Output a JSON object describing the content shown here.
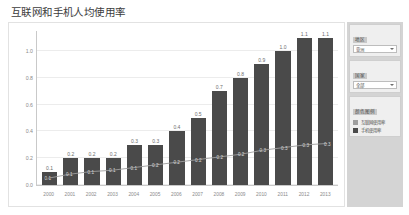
{
  "header": {
    "title": "互联网和手机人均使用率"
  },
  "chart_data": {
    "type": "bar",
    "title": "互联网和手机人均使用率",
    "xlabel": "",
    "ylabel": "",
    "ylim": [
      0.0,
      1.15
    ],
    "grid": true,
    "legend_position": "right-panel",
    "categories": [
      "2000",
      "2001",
      "2002",
      "2003",
      "2004",
      "2005",
      "2006",
      "2007",
      "2008",
      "2009",
      "2010",
      "2011",
      "2012",
      "2013"
    ],
    "ytick_labels": [
      "0.0",
      "0.2",
      "0.4",
      "0.6",
      "0.8",
      "1.0"
    ],
    "ytick_values": [
      0.0,
      0.2,
      0.4,
      0.6,
      0.8,
      1.0
    ],
    "series": [
      {
        "name": "手机使用率",
        "type": "bar",
        "color": "#4a4a4a",
        "values": [
          0.1,
          0.2,
          0.2,
          0.2,
          0.3,
          0.3,
          0.4,
          0.5,
          0.7,
          0.8,
          0.9,
          1.0,
          1.1,
          1.1
        ],
        "labels": [
          "0.1",
          "0.2",
          "0.2",
          "0.2",
          "0.3",
          "0.3",
          "0.4",
          "0.5",
          "0.7",
          "0.8",
          "0.9",
          "1.0",
          "1.1",
          "1.1"
        ]
      },
      {
        "name": "互联网使用率",
        "type": "line",
        "color": "#9e9e9e",
        "values": [
          0.05,
          0.08,
          0.1,
          0.11,
          0.13,
          0.15,
          0.17,
          0.19,
          0.21,
          0.23,
          0.26,
          0.28,
          0.3,
          0.31
        ],
        "labels": [
          "0.1",
          "0.1",
          "0.1",
          "0.1",
          "0.1",
          "0.2",
          "0.2",
          "0.2",
          "0.2",
          "0.2",
          "0.3",
          "0.3",
          "0.3",
          "0.3"
        ]
      }
    ]
  },
  "side_panel": {
    "region": {
      "label": "地区",
      "value": "亚洲"
    },
    "country": {
      "label": "国家",
      "value": "全部"
    },
    "legend": {
      "label": "颜色图例",
      "items": [
        {
          "label": "互联网使用率",
          "color": "#9e9e9e"
        },
        {
          "label": "手机使用率",
          "color": "#4a4a4a"
        }
      ]
    }
  }
}
